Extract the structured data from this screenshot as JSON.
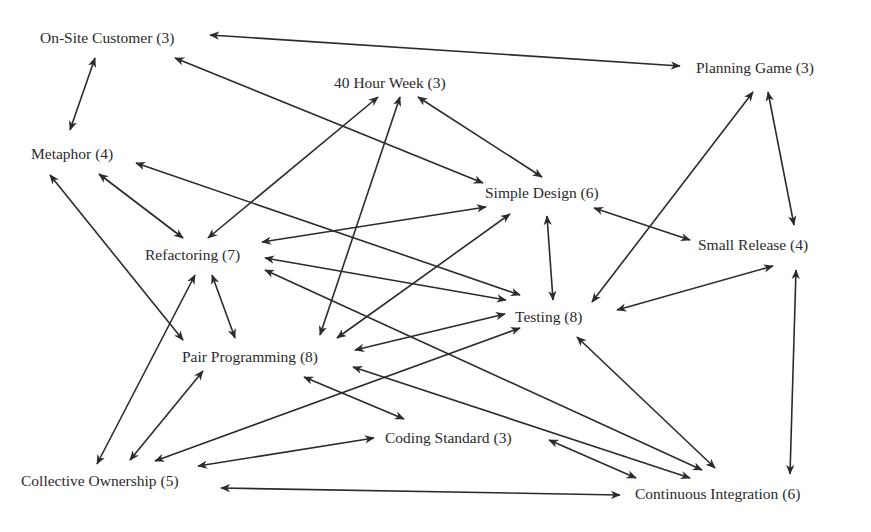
{
  "diagram": {
    "colors": {
      "line": "#2b2b2b",
      "text": "#2a2a2a",
      "background": "#ffffff"
    },
    "nodes": [
      {
        "id": "onsite",
        "label": "On-Site Customer (3)",
        "x": 40,
        "y": 43
      },
      {
        "id": "week40",
        "label": "40 Hour Week (3)",
        "x": 334,
        "y": 88
      },
      {
        "id": "planning",
        "label": "Planning Game (3)",
        "x": 696,
        "y": 73
      },
      {
        "id": "metaphor",
        "label": "Metaphor (4)",
        "x": 31,
        "y": 159
      },
      {
        "id": "simple",
        "label": "Simple Design (6)",
        "x": 485,
        "y": 198
      },
      {
        "id": "refactor",
        "label": "Refactoring (7)",
        "x": 145,
        "y": 260
      },
      {
        "id": "small",
        "label": "Small Release (4)",
        "x": 698,
        "y": 250
      },
      {
        "id": "testing",
        "label": "Testing (8)",
        "x": 515,
        "y": 322
      },
      {
        "id": "pair",
        "label": "Pair Programming (8)",
        "x": 182,
        "y": 362
      },
      {
        "id": "coding",
        "label": "Coding Standard (3)",
        "x": 385,
        "y": 443
      },
      {
        "id": "collective",
        "label": "Collective Ownership (5)",
        "x": 21,
        "y": 486
      },
      {
        "id": "ci",
        "label": "Continuous Integration (6)",
        "x": 635,
        "y": 499
      }
    ],
    "edges": [
      {
        "from": "onsite",
        "to": "planning",
        "x1": 210,
        "y1": 35,
        "x2": 680,
        "y2": 66
      },
      {
        "from": "onsite",
        "to": "metaphor",
        "x1": 95,
        "y1": 58,
        "x2": 70,
        "y2": 130
      },
      {
        "from": "onsite",
        "to": "simple",
        "x1": 175,
        "y1": 58,
        "x2": 483,
        "y2": 183
      },
      {
        "from": "week40",
        "to": "refactor",
        "x1": 378,
        "y1": 97,
        "x2": 208,
        "y2": 238
      },
      {
        "from": "week40",
        "to": "pair",
        "x1": 400,
        "y1": 97,
        "x2": 320,
        "y2": 335
      },
      {
        "from": "week40",
        "to": "simple",
        "x1": 418,
        "y1": 97,
        "x2": 542,
        "y2": 177
      },
      {
        "from": "planning",
        "to": "small",
        "x1": 768,
        "y1": 92,
        "x2": 794,
        "y2": 225
      },
      {
        "from": "planning",
        "to": "testing",
        "x1": 753,
        "y1": 92,
        "x2": 592,
        "y2": 302
      },
      {
        "from": "metaphor",
        "to": "refactor",
        "x1": 99,
        "y1": 174,
        "x2": 183,
        "y2": 238
      },
      {
        "from": "metaphor",
        "to": "testing",
        "x1": 136,
        "y1": 163,
        "x2": 520,
        "y2": 295
      },
      {
        "from": "metaphor",
        "to": "pair",
        "x1": 50,
        "y1": 175,
        "x2": 183,
        "y2": 340
      },
      {
        "from": "simple",
        "to": "refactor",
        "x1": 486,
        "y1": 207,
        "x2": 262,
        "y2": 242
      },
      {
        "from": "simple",
        "to": "small",
        "x1": 594,
        "y1": 208,
        "x2": 690,
        "y2": 240
      },
      {
        "from": "simple",
        "to": "testing",
        "x1": 547,
        "y1": 216,
        "x2": 553,
        "y2": 300
      },
      {
        "from": "simple",
        "to": "pair",
        "x1": 510,
        "y1": 214,
        "x2": 337,
        "y2": 338
      },
      {
        "from": "refactor",
        "to": "testing",
        "x1": 265,
        "y1": 258,
        "x2": 506,
        "y2": 300
      },
      {
        "from": "refactor",
        "to": "ci",
        "x1": 265,
        "y1": 270,
        "x2": 702,
        "y2": 470
      },
      {
        "from": "refactor",
        "to": "pair",
        "x1": 212,
        "y1": 275,
        "x2": 235,
        "y2": 338
      },
      {
        "from": "refactor",
        "to": "collective",
        "x1": 195,
        "y1": 275,
        "x2": 97,
        "y2": 464
      },
      {
        "from": "small",
        "to": "testing",
        "x1": 773,
        "y1": 266,
        "x2": 617,
        "y2": 310
      },
      {
        "from": "small",
        "to": "ci",
        "x1": 796,
        "y1": 270,
        "x2": 790,
        "y2": 474
      },
      {
        "from": "testing",
        "to": "pair",
        "x1": 505,
        "y1": 314,
        "x2": 355,
        "y2": 350
      },
      {
        "from": "testing",
        "to": "collective",
        "x1": 520,
        "y1": 328,
        "x2": 155,
        "y2": 461
      },
      {
        "from": "testing",
        "to": "ci",
        "x1": 577,
        "y1": 337,
        "x2": 715,
        "y2": 468
      },
      {
        "from": "pair",
        "to": "coding",
        "x1": 304,
        "y1": 377,
        "x2": 404,
        "y2": 419
      },
      {
        "from": "pair",
        "to": "ci",
        "x1": 353,
        "y1": 367,
        "x2": 690,
        "y2": 478
      },
      {
        "from": "pair",
        "to": "collective",
        "x1": 203,
        "y1": 371,
        "x2": 130,
        "y2": 460
      },
      {
        "from": "coding",
        "to": "collective",
        "x1": 374,
        "y1": 438,
        "x2": 198,
        "y2": 466
      },
      {
        "from": "coding",
        "to": "ci",
        "x1": 549,
        "y1": 440,
        "x2": 636,
        "y2": 478
      },
      {
        "from": "collective",
        "to": "ci",
        "x1": 221,
        "y1": 488,
        "x2": 620,
        "y2": 495
      }
    ]
  }
}
